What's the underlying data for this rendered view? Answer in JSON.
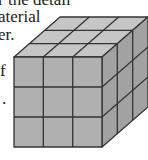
{
  "text_fragments": [
    {
      "text": "r the detail",
      "x": -2,
      "y": -9
    },
    {
      "text": "aterial",
      "x": -2,
      "y": 8
    },
    {
      "text": "er.",
      "x": -2,
      "y": 26
    },
    {
      "text": "f",
      "x": 0,
      "y": 62
    },
    {
      "text": ".",
      "x": 2,
      "y": 90
    }
  ],
  "figure": {
    "type": "cube-3x3x3",
    "colors": {
      "top": "#c6c6c6",
      "front": "#b0b0b0",
      "right": "#a2a2a2",
      "stroke": "#333333"
    }
  }
}
